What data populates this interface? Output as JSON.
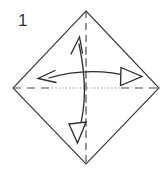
{
  "figure": {
    "step_label": "1",
    "colors": {
      "background": "#ffffff",
      "paper_edge": "#3a3a3a",
      "fold_line": "#4a4a4a",
      "crease_dotted": "#6e6e6e",
      "arrow": "#2b2b2b"
    },
    "shapes": {
      "paper": {
        "name": "square-diamond",
        "points": "86,11 159,88 86,164 13,88",
        "stroke_width": 1.1
      },
      "vertical_fold": {
        "name": "vertical-fold-line",
        "x": 86,
        "y1": 11,
        "y2": 164,
        "dash": "7,5"
      },
      "horizontal_fold": {
        "name": "horizontal-fold-line",
        "y": 88,
        "x1": 13,
        "x2": 159,
        "dash": "8,6"
      },
      "vertical_dotted": {
        "name": "vertical-dotted-crease",
        "x": 86,
        "y1": 50,
        "y2": 130,
        "dash": "1,3"
      },
      "horizontal_dotted": {
        "name": "horizontal-dotted-crease",
        "y": 88,
        "x1": 52,
        "x2": 122,
        "dash": "1,2.5"
      },
      "vertical_arrow": {
        "name": "vertical-double-arrow",
        "path": "M 79 42 C 85 70, 87 105, 79 132",
        "head_top": "72,51 79.5,38 82,53",
        "head_bottom": "70,126 85,124 77,143",
        "head_top_style": "open-v",
        "head_bottom_style": "hollow-triangle"
      },
      "horizontal_arrow": {
        "name": "horizontal-double-arrow",
        "path": "M 47 78 C 75 70, 105 70, 134 77",
        "head_left": "54,71 41,78.5 56,81",
        "head_right": "122,68 141,76.5 121,85",
        "head_left_style": "open-v",
        "head_right_style": "hollow-triangle"
      }
    }
  }
}
